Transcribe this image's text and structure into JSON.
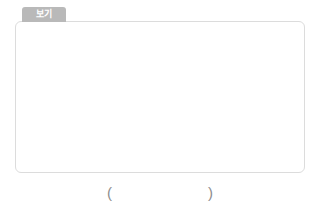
{
  "tab": {
    "label": "보기"
  },
  "answer": {
    "open_paren": "(",
    "close_paren": ")"
  },
  "palette": {
    "dark": "#595959",
    "medium": "#b0b0b0",
    "light": "#d9d9d9",
    "needle": "#f2f2f2",
    "panel_border": "#dcdcdc",
    "tab_bg": "#b9b9b9",
    "marker_text": "#7a7a7a",
    "paren_text": "#8d8d8d"
  },
  "chart_data": {
    "type": "pie",
    "title": "보기",
    "legend": "none",
    "note": "Five clock-face pie diagrams, each with a white needle pointing to 12 o'clock. Angles measured clockwise from 12 o'clock (0 degrees).",
    "charts": [
      {
        "id": "pie-1",
        "marker": "㉠",
        "cx": 78,
        "cy": 62,
        "r": 28,
        "slices": [
          {
            "name": "light",
            "start_deg": 0,
            "end_deg": 60,
            "fraction": 0.1667,
            "color": "#d9d9d9"
          },
          {
            "name": "dark",
            "start_deg": 60,
            "end_deg": 180,
            "fraction": 0.3333,
            "color": "#595959"
          },
          {
            "name": "medium",
            "start_deg": 180,
            "end_deg": 360,
            "fraction": 0.5,
            "color": "#b0b0b0"
          }
        ]
      },
      {
        "id": "pie-2",
        "marker": "㉡",
        "cx": 166,
        "cy": 62,
        "r": 28,
        "slices": [
          {
            "name": "light",
            "start_deg": 0,
            "end_deg": 90,
            "fraction": 0.25,
            "color": "#d9d9d9"
          },
          {
            "name": "dark",
            "start_deg": 90,
            "end_deg": 360,
            "fraction": 0.75,
            "color": "#595959"
          }
        ]
      },
      {
        "id": "pie-3",
        "marker": "㉢",
        "cx": 253,
        "cy": 62,
        "r": 28,
        "slices": [
          {
            "name": "light",
            "start_deg": 0,
            "end_deg": 90,
            "fraction": 0.25,
            "color": "#d9d9d9"
          },
          {
            "name": "dark",
            "start_deg": 90,
            "end_deg": 180,
            "fraction": 0.25,
            "color": "#595959"
          },
          {
            "name": "medium",
            "start_deg": 180,
            "end_deg": 360,
            "fraction": 0.5,
            "color": "#b0b0b0"
          }
        ]
      },
      {
        "id": "pie-4",
        "marker": "㉣",
        "cx": 124,
        "cy": 136,
        "r": 28,
        "slices": [
          {
            "name": "light",
            "start_deg": 0,
            "end_deg": 120,
            "fraction": 0.3333,
            "color": "#d9d9d9"
          },
          {
            "name": "medium",
            "start_deg": 120,
            "end_deg": 240,
            "fraction": 0.3333,
            "color": "#b0b0b0"
          },
          {
            "name": "dark",
            "start_deg": 240,
            "end_deg": 360,
            "fraction": 0.3333,
            "color": "#595959"
          }
        ]
      },
      {
        "id": "pie-5",
        "marker": "㉤",
        "cx": 211,
        "cy": 136,
        "r": 28,
        "slices": [
          {
            "name": "light",
            "start_deg": 0,
            "end_deg": 180,
            "fraction": 0.5,
            "color": "#d9d9d9"
          },
          {
            "name": "medium",
            "start_deg": 180,
            "end_deg": 270,
            "fraction": 0.25,
            "color": "#b0b0b0"
          },
          {
            "name": "dark",
            "start_deg": 270,
            "end_deg": 360,
            "fraction": 0.25,
            "color": "#595959"
          }
        ]
      }
    ],
    "markers": [
      "㉠",
      "㉡",
      "㉢",
      "㉣",
      "㉤"
    ],
    "marker_positions": [
      {
        "x": 36,
        "y": 41
      },
      {
        "x": 124,
        "y": 41
      },
      {
        "x": 210,
        "y": 41
      },
      {
        "x": 82,
        "y": 115
      },
      {
        "x": 169,
        "y": 115
      }
    ]
  }
}
